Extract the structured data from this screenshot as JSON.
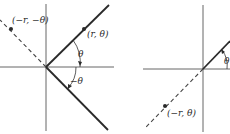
{
  "figure": {
    "left_panel": {
      "labels": {
        "point_neg": "(−r, −θ)",
        "point_pos": "(r, θ)",
        "angle_pos": "θ",
        "angle_neg": "−θ"
      }
    },
    "right_panel": {
      "labels": {
        "point_neg": "(−r, θ)",
        "angle_pos": "θ"
      }
    },
    "colors": {
      "line": "#2a2a2a",
      "axis": "#555555",
      "background": "#ffffff"
    }
  }
}
